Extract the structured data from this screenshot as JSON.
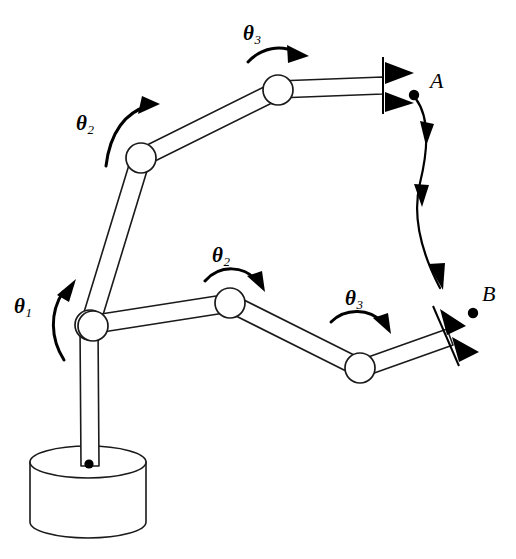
{
  "figure": {
    "background_color": "#ffffff",
    "ink_color": "#000000"
  },
  "angle_labels": [
    {
      "id": "theta1-upper-config",
      "symbol": "θ",
      "subscript": "1",
      "x": 14,
      "y": 296,
      "arrow": "ccw-up"
    },
    {
      "id": "theta2-upper-config",
      "symbol": "θ",
      "subscript": "2",
      "x": 76,
      "y": 113,
      "arrow": "cw-right"
    },
    {
      "id": "theta3-upper-config",
      "symbol": "θ",
      "subscript": "3",
      "x": 243,
      "y": 23,
      "arrow": "cw-right"
    },
    {
      "id": "theta2-lower-config",
      "symbol": "θ",
      "subscript": "2",
      "x": 212,
      "y": 245,
      "arrow": "cw-down-right"
    },
    {
      "id": "theta3-lower-config",
      "symbol": "θ",
      "subscript": "3",
      "x": 345,
      "y": 288,
      "arrow": "cw-down-right"
    }
  ],
  "point_labels": [
    {
      "id": "point-a",
      "text": "A",
      "x": 430,
      "y": 70,
      "dot_x": 414,
      "dot_y": 95
    },
    {
      "id": "point-b",
      "text": "B",
      "x": 482,
      "y": 283,
      "dot_x": 473,
      "dot_y": 313
    }
  ],
  "trajectory": {
    "id": "trajectory-a-to-b",
    "from": "A",
    "to": "B",
    "style": "curved-arrow"
  },
  "base": {
    "id": "robot-base",
    "shape": "cylinder",
    "center_x": 88,
    "top_y": 462,
    "rx": 58,
    "ry": 16,
    "height": 76
  },
  "kinematics": {
    "description": "Three-degree-of-freedom arm shown at start pose (gripper at A) and end pose (gripper at B)",
    "joint_count": 3,
    "configurations": [
      {
        "id": "configuration-upper",
        "end_effector": "A",
        "joints": [
          {
            "name": "shoulder",
            "x": 90,
            "y": 325
          },
          {
            "name": "elbow",
            "x": 141,
            "y": 158
          },
          {
            "name": "wrist",
            "x": 278,
            "y": 90
          },
          {
            "name": "tip",
            "x": 382,
            "y": 85
          }
        ]
      },
      {
        "id": "configuration-lower",
        "end_effector": "B",
        "joints": [
          {
            "name": "shoulder",
            "x": 90,
            "y": 325
          },
          {
            "name": "elbow",
            "x": 230,
            "y": 303
          },
          {
            "name": "wrist",
            "x": 360,
            "y": 368
          },
          {
            "name": "tip",
            "x": 447,
            "y": 338
          }
        ]
      }
    ],
    "column": {
      "top_x": 90,
      "top_y": 325,
      "bottom_x": 88,
      "bottom_y": 468
    }
  },
  "grippers": [
    {
      "id": "gripper-at-a",
      "orientation": "vertical",
      "jaw_count": 2,
      "x": 383,
      "y": 85
    },
    {
      "id": "gripper-at-b",
      "orientation": "tilted",
      "jaw_count": 2,
      "x": 450,
      "y": 336
    }
  ]
}
